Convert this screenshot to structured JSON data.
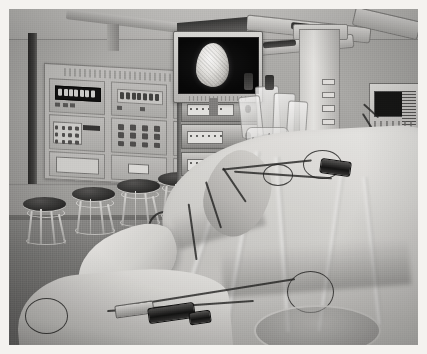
{
  "image": {
    "title": "Operating room with draped patient and video endoscopy tower",
    "scene_type": "photograph",
    "width_px": 427,
    "height_px": 354,
    "border": "thin white photo margin on all four sides",
    "tone": "low-saturation / desaturated greyish-sepia colour photograph",
    "grain": "visible film grain and scan noise"
  },
  "room": {
    "name": "operating theatre",
    "wall_label": "pale grey-green painted wall with horizontal seam",
    "floor_label": "grey vinyl floor",
    "baseboard_label": "dark grey skirting",
    "door_edge_label": "dark vertical door frame edge at far left"
  },
  "wall_panel": {
    "name": "wall-mounted medical gas and control panel",
    "cells": [
      {
        "kind": "lcd-display",
        "segments": 7,
        "leds": 3
      },
      {
        "kind": "lcd-display",
        "segments": 7,
        "leds": 2
      },
      {
        "kind": "lcd-display",
        "segments": 6,
        "leds": 2
      },
      {
        "kind": "keypad",
        "buttons": 12
      },
      {
        "kind": "button-grid",
        "buttons": 12
      },
      {
        "kind": "switch-block",
        "buttons": 8
      },
      {
        "kind": "blank-plate",
        "buttons": 0
      },
      {
        "kind": "small-readout",
        "buttons": 1
      },
      {
        "kind": "blank-plate",
        "buttons": 0
      }
    ]
  },
  "stools": {
    "name": "row of operating-room stools",
    "count": 5,
    "description": "chrome-framed round stools with dark padded seats, lined against the wall"
  },
  "tower": {
    "name": "video endoscopy equipment tower",
    "units": [
      {
        "label": "light-source-unit"
      },
      {
        "label": "camera-control-unit"
      },
      {
        "label": "insufflator-unit"
      },
      {
        "label": "electrosurgical-generator"
      },
      {
        "label": "video-recorder-unit"
      }
    ],
    "wheels": 2
  },
  "monitor": {
    "name": "endoscopic video monitor",
    "screen_content": "bright white ovoid tissue structure on black background",
    "mounted_on": "top of equipment tower"
  },
  "lights": {
    "name": "ceiling surgical light booms",
    "arms": 3,
    "description": "articulated overhead lighting and service arms"
  },
  "column": {
    "name": "ceiling service column / pendant",
    "ports": 4,
    "iv_bags": 4,
    "description": "white pendant column with gas outlets and hanging IV fluid bags"
  },
  "anesthesia": {
    "name": "anaesthesia and vital-signs monitor",
    "position": "far right edge of frame"
  },
  "patient": {
    "name": "draped patient on operating table",
    "drape_label": "pale green-white surgical drapes",
    "exposed_limb_label": "padded / wrapped limb in foreground"
  },
  "cables": {
    "name": "instrument cables and tubing",
    "count": 6,
    "connector_label": "black and chrome instrument connector in foreground",
    "tray_label": "stainless instrument bowl at lower edge"
  },
  "colors": {
    "wall": "#b2afa7",
    "floor": "#7a7872",
    "drape": "#e2dfd6",
    "panel": "#c0bdb5",
    "screen_black": "#0b0b0b",
    "tissue_white": "#f5f2e9",
    "metal": "#d8d5cd",
    "cable_dark": "#262421",
    "photo_border": "#ffffff"
  }
}
